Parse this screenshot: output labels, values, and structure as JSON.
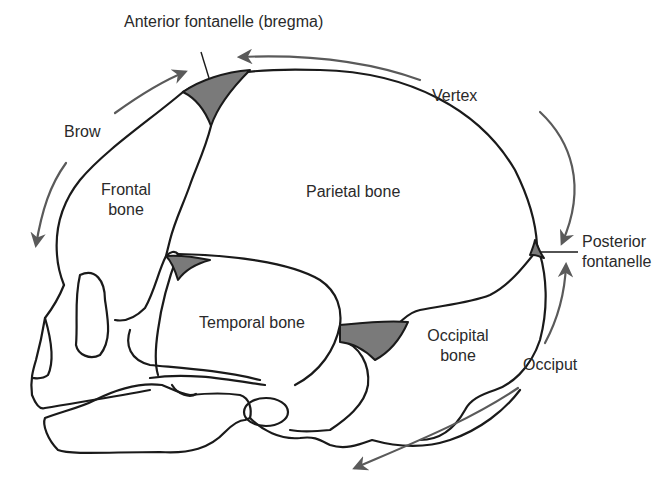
{
  "diagram": {
    "colors": {
      "outline": "#1a1a1a",
      "fontanelle_fill": "#7a7a7a",
      "arrow": "#5a5a5a",
      "text": "#2a2a2a",
      "background": "#ffffff"
    },
    "labels": {
      "anterior_fontanelle": "Anterior fontanelle (bregma)",
      "vertex": "Vertex",
      "brow": "Brow",
      "frontal_bone_line1": "Frontal",
      "frontal_bone_line2": "bone",
      "parietal_bone": "Parietal bone",
      "posterior_fontanelle_line1": "Posterior",
      "posterior_fontanelle_line2": "fontanelle",
      "temporal_bone": "Temporal bone",
      "occipital_bone_line1": "Occipital",
      "occipital_bone_line2": "bone",
      "occiput": "Occiput"
    },
    "arrows": [
      {
        "name": "brow-to-bregma",
        "direction": "toward anterior fontanelle"
      },
      {
        "name": "vertex-to-bregma",
        "direction": "toward anterior fontanelle"
      },
      {
        "name": "vertex-to-posterior",
        "direction": "toward posterior fontanelle"
      },
      {
        "name": "brow-down",
        "direction": "down toward face"
      },
      {
        "name": "occiput-up",
        "direction": "up toward posterior fontanelle"
      },
      {
        "name": "occiput-down",
        "direction": "down beneath skull"
      }
    ]
  }
}
